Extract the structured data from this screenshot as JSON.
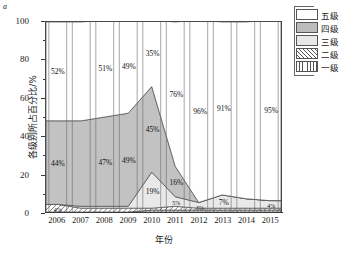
{
  "panel": {
    "letter": "a"
  },
  "axes": {
    "y_title": "各级别所占百分比/%",
    "x_title": "年份",
    "y_ticks": [
      0,
      20,
      40,
      60,
      80,
      100
    ],
    "x_ticks": [
      "2006",
      "2007",
      "2008",
      "2009",
      "2010",
      "2011",
      "2012",
      "2013",
      "2014",
      "2015"
    ]
  },
  "legend": {
    "items": [
      {
        "label": "五级",
        "pattern": "solid-white",
        "color": "#ffffff"
      },
      {
        "label": "四级",
        "pattern": "solid-gray",
        "color": "#bcbcbc"
      },
      {
        "label": "三级",
        "pattern": "solid-light",
        "color": "#e8e8e8"
      },
      {
        "label": "二级",
        "pattern": "diagonal",
        "color": "#ffffff"
      },
      {
        "label": "一级",
        "pattern": "vertical",
        "color": "#ffffff"
      }
    ]
  },
  "chart_data": {
    "type": "area",
    "title": "",
    "subtitle": "",
    "xlabel": "年份",
    "ylabel": "各级别所占百分比/%",
    "ylim": [
      0,
      100
    ],
    "grid": false,
    "legend_position": "top-right",
    "stacked": true,
    "stack_order_bottom_to_top": [
      "一级",
      "二级",
      "三级",
      "四级",
      "五级"
    ],
    "x": [
      "2006",
      "2007",
      "2008",
      "2009",
      "2010",
      "2011",
      "2012",
      "2013",
      "2014",
      "2015"
    ],
    "series": [
      {
        "name": "一级",
        "values": [
          0,
          0,
          0,
          0,
          1,
          1,
          1,
          1,
          1,
          1
        ]
      },
      {
        "name": "二级",
        "values": [
          4,
          2,
          2,
          2,
          1,
          2,
          1,
          1,
          1,
          1
        ]
      },
      {
        "name": "三级",
        "values": [
          0,
          1,
          1,
          1,
          19,
          5,
          3,
          7,
          5,
          4
        ]
      },
      {
        "name": "四级",
        "values": [
          44,
          45,
          47,
          49,
          45,
          16,
          0,
          0,
          0,
          0
        ]
      },
      {
        "name": "五级",
        "values": [
          52,
          52,
          51,
          49,
          35,
          76,
          96,
          91,
          93,
          95
        ]
      }
    ],
    "annotations": [
      {
        "year": "2006",
        "series": "五级",
        "text": "52%"
      },
      {
        "year": "2006",
        "series": "四级",
        "text": "44%"
      },
      {
        "year": "2006",
        "series": "二级",
        "text": "4%"
      },
      {
        "year": "2008",
        "series": "五级",
        "text": "51%"
      },
      {
        "year": "2008",
        "series": "四级",
        "text": "47%"
      },
      {
        "year": "2009",
        "series": "五级",
        "text": "49%"
      },
      {
        "year": "2009",
        "series": "四级",
        "text": "49%"
      },
      {
        "year": "2010",
        "series": "五级",
        "text": "35%"
      },
      {
        "year": "2010",
        "series": "四级",
        "text": "45%"
      },
      {
        "year": "2010",
        "series": "三级",
        "text": "19%"
      },
      {
        "year": "2011",
        "series": "五级",
        "text": "76%"
      },
      {
        "year": "2011",
        "series": "四级",
        "text": "16%"
      },
      {
        "year": "2011",
        "series": "三级",
        "text": "5%"
      },
      {
        "year": "2012",
        "series": "五级",
        "text": "96%"
      },
      {
        "year": "2012",
        "series": "三级",
        "text": "3%"
      },
      {
        "year": "2013",
        "series": "五级",
        "text": "91%"
      },
      {
        "year": "2013",
        "series": "三级",
        "text": "7%"
      },
      {
        "year": "2015",
        "series": "五级",
        "text": "95%"
      },
      {
        "year": "2015",
        "series": "三级",
        "text": "4%"
      }
    ]
  },
  "labels": {
    "l_2006_5": "52%",
    "l_2006_4": "44%",
    "l_2006_2": "4%",
    "l_2008_5": "51%",
    "l_2008_4": "47%",
    "l_2009_5": "49%",
    "l_2009_4": "49%",
    "l_2010_5": "35%",
    "l_2010_4": "45%",
    "l_2010_3": "19%",
    "l_2011_5": "76%",
    "l_2011_4": "16%",
    "l_2011_3": "5%",
    "l_2012_5": "96%",
    "l_2012_3": "3%",
    "l_2013_5": "91%",
    "l_2013_3": "7%",
    "l_2015_5": "95%",
    "l_2015_3": "4%"
  }
}
